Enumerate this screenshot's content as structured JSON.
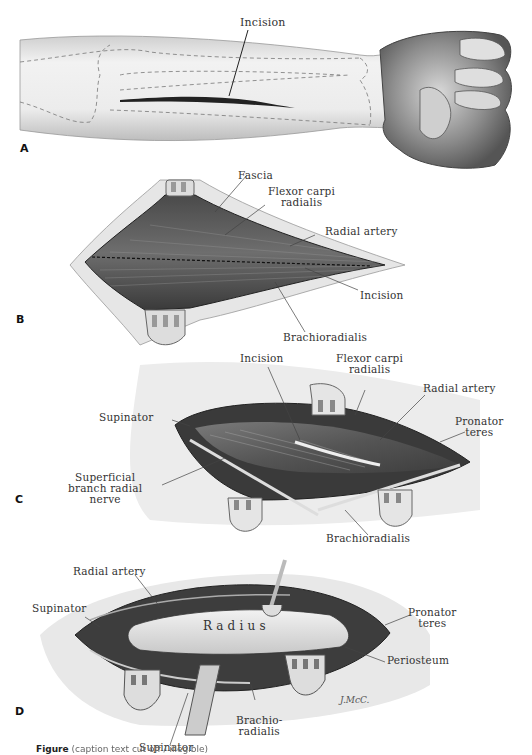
{
  "figure": {
    "panels": [
      {
        "id": "A",
        "labels": [
          "Incision"
        ]
      },
      {
        "id": "B",
        "labels": [
          "Fascia",
          "Flexor carpi radialis",
          "Radial artery",
          "Incision",
          "Brachioradialis"
        ]
      },
      {
        "id": "C",
        "labels": [
          "Incision",
          "Flexor carpi radialis",
          "Radial artery",
          "Supinator",
          "Pronator teres",
          "Superficial branch radial nerve",
          "Brachioradialis"
        ]
      },
      {
        "id": "D",
        "labels": [
          "Radial artery",
          "Supinator",
          "Radius",
          "Pronator teres",
          "Periosteum",
          "Brachio-radialis",
          "Supinator"
        ]
      }
    ],
    "text": {
      "a_incision": "Incision",
      "b_fascia": "Fascia",
      "b_fcr_1": "Flexor carpi",
      "b_fcr_2": "radialis",
      "b_radial_artery": "Radial artery",
      "b_incision": "Incision",
      "b_brachioradialis": "Brachioradialis",
      "c_incision": "Incision",
      "c_fcr_1": "Flexor carpi",
      "c_fcr_2": "radialis",
      "c_radial_artery": "Radial artery",
      "c_supinator": "Supinator",
      "c_pronator_1": "Pronator",
      "c_pronator_2": "teres",
      "c_nerve_1": "Superficial",
      "c_nerve_2": "branch radial",
      "c_nerve_3": "nerve",
      "c_brachioradialis": "Brachioradialis",
      "d_radial_artery": "Radial artery",
      "d_supinator_top": "Supinator",
      "d_radius": "R a d i u s",
      "d_pronator_1": "Pronator",
      "d_pronator_2": "teres",
      "d_periosteum": "Periosteum",
      "d_brachio_1": "Brachio-",
      "d_brachio_2": "radialis",
      "d_supinator_bottom": "Supinator",
      "signature": "J.McC.",
      "panel_a": "A",
      "panel_b": "B",
      "panel_c": "C",
      "panel_d": "D"
    },
    "caption": {
      "prefix": "Figure",
      "rest_unreadable": "(caption text cut off / illegible)"
    }
  }
}
